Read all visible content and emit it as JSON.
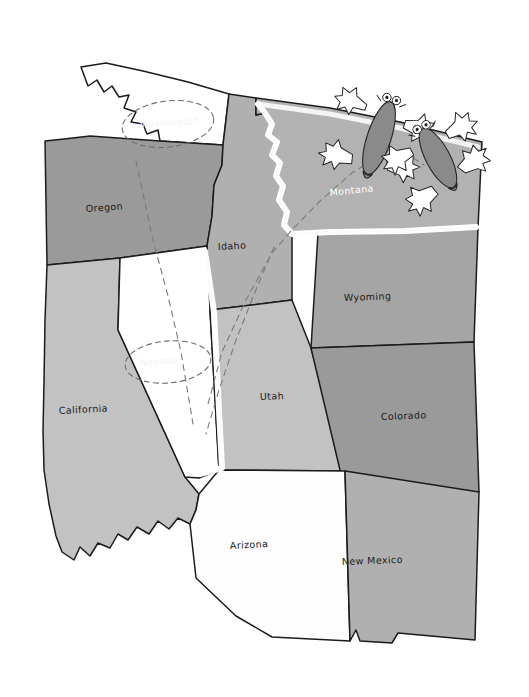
{
  "figure": {
    "kind": "hand-drawn-cartoon-map",
    "region_title": "Western United States",
    "background_color": "#ffffff",
    "outline_color": "#1b1b1b"
  },
  "palette": {
    "white": "#ffffff",
    "near_white": "#fbfbfb",
    "light_gray": "#cacaca",
    "mid_gray": "#b5b5b5",
    "gray": "#a8a8a8",
    "dark_gray": "#9a9a9a",
    "darkest_gray": "#8f8f8f",
    "ink": "#1b1b1b",
    "dash": "#7a7a7a",
    "creature_body": "#8a8a8a",
    "glow": "#ffffff"
  },
  "states": [
    {
      "id": "washington",
      "name": "Washington",
      "label": "Washington",
      "label_style": "ghost-white",
      "fill": "#ffffff",
      "label_x": 166,
      "label_y": 125,
      "label_rotate": -4,
      "has_dashed_oval": true,
      "highlighted": false
    },
    {
      "id": "oregon",
      "name": "Oregon",
      "label": "Oregon",
      "label_style": "dark",
      "fill": "#9a9a9a",
      "label_x": 104,
      "label_y": 209,
      "label_rotate": -4,
      "has_dashed_oval": false,
      "highlighted": false
    },
    {
      "id": "idaho",
      "name": "Idaho",
      "label": "Idaho",
      "label_style": "dark",
      "fill": "#b0b0b0",
      "label_x": 234,
      "label_y": 246,
      "label_rotate": -3,
      "has_dashed_oval": false,
      "highlighted": false
    },
    {
      "id": "montana",
      "name": "Montana",
      "label": "Montana",
      "label_style": "white",
      "fill": "#b2b2b2",
      "label_x": 340,
      "label_y": 189,
      "label_rotate": -6,
      "has_dashed_oval": false,
      "highlighted": true
    },
    {
      "id": "wyoming",
      "name": "Wyoming",
      "label": "Wyoming",
      "label_style": "dark",
      "fill": "#a5a5a5",
      "label_x": 349,
      "label_y": 298,
      "label_rotate": -2,
      "has_dashed_oval": false,
      "highlighted": false
    },
    {
      "id": "california",
      "name": "California",
      "label": "California",
      "label_style": "dark",
      "fill": "#c2c2c2",
      "label_x": 60,
      "label_y": 411,
      "label_rotate": -3,
      "has_dashed_oval": false,
      "highlighted": false
    },
    {
      "id": "nevada",
      "name": "Nevada",
      "label": "Nevada",
      "label_style": "ghost-white",
      "fill": "#ffffff",
      "label_x": 136,
      "label_y": 362,
      "label_rotate": -4,
      "has_dashed_oval": true,
      "highlighted": true
    },
    {
      "id": "utah",
      "name": "Utah",
      "label": "Utah",
      "label_style": "dark",
      "fill": "#c2c2c2",
      "label_x": 263,
      "label_y": 397,
      "label_rotate": -2,
      "has_dashed_oval": false,
      "highlighted": false
    },
    {
      "id": "colorado",
      "name": "Colorado",
      "label": "Colorado",
      "label_style": "dark",
      "fill": "#9a9a9a",
      "label_x": 386,
      "label_y": 417,
      "label_rotate": -2,
      "has_dashed_oval": false,
      "highlighted": false
    },
    {
      "id": "arizona",
      "name": "Arizona",
      "label": "Arizona",
      "label_style": "dark",
      "fill": "#fdfdfd",
      "label_x": 235,
      "label_y": 546,
      "label_rotate": -3,
      "has_dashed_oval": false,
      "highlighted": false
    },
    {
      "id": "new-mexico",
      "name": "New Mexico",
      "label": "New Mexico",
      "label_style": "dark",
      "fill": "#b0b0b0",
      "label_x": 347,
      "label_y": 562,
      "label_rotate": -2,
      "has_dashed_oval": false,
      "highlighted": false
    }
  ],
  "annotations": {
    "dashed_route_count": 3,
    "dashed_ovals": [
      "washington",
      "nevada"
    ],
    "glow_outlines": [
      "montana",
      "nevada"
    ]
  },
  "creatures": [
    {
      "id": "creature-left",
      "kind": "gopher-mole",
      "pose": "climbing-over-border",
      "x": 379,
      "y": 135,
      "rotate": 18,
      "body_color": "#8a8a8a",
      "paw_color": "#ffffff"
    },
    {
      "id": "creature-right",
      "kind": "gopher-mole",
      "pose": "climbing-over-border",
      "x": 438,
      "y": 156,
      "rotate": -28,
      "body_color": "#8a8a8a",
      "paw_color": "#ffffff"
    }
  ]
}
